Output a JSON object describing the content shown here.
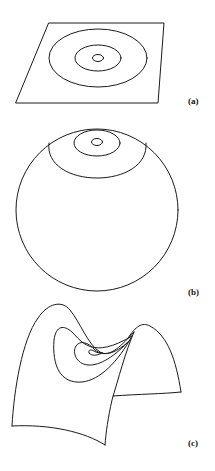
{
  "figure": {
    "panels": [
      {
        "id": "a",
        "label": "(a)",
        "surface": "plane",
        "contours": 3
      },
      {
        "id": "b",
        "label": "(b)",
        "surface": "sphere",
        "contours": 3
      },
      {
        "id": "c",
        "label": "(c)",
        "surface": "saddle",
        "contours": 3
      }
    ]
  },
  "colors": {
    "line": "#1a1a1a",
    "background": "#ffffff"
  }
}
